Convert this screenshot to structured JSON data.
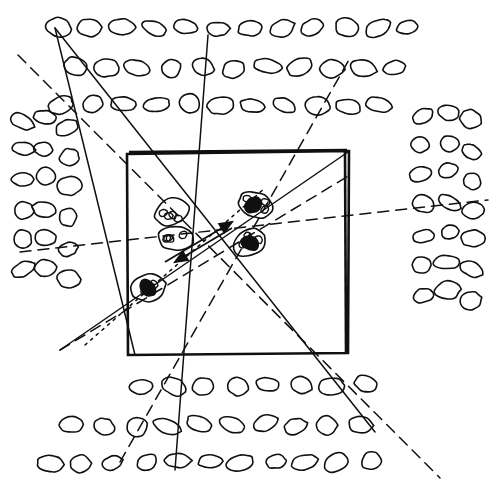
{
  "figure": {
    "style": "pen-and-ink line drawing, black on white",
    "canvas": {
      "width": 498,
      "height": 497,
      "background": "#ffffff"
    },
    "stroke_color": "#101010",
    "labels_visible": []
  },
  "chart_data": {
    "type": "scatter",
    "title": "",
    "xlabel": "",
    "ylabel": "",
    "grid": false,
    "legend": null,
    "xlim": [
      0,
      498
    ],
    "ylim": [
      0,
      497
    ],
    "boundary_box": {
      "x": 127,
      "y": 152,
      "width": 222,
      "height": 202
    },
    "series": [
      {
        "name": "background-oval-field",
        "marker": "ellipse-outline",
        "rows": [
          {
            "row": "top-1",
            "y": 28,
            "x": [
              58,
              90,
              122,
              153,
              185,
              217,
              249,
              281,
              313,
              345,
              377,
              409
            ]
          },
          {
            "row": "top-2",
            "y": 68,
            "x": [
              74,
              106,
              138,
              170,
              202,
              234,
              266,
              298,
              330,
              362,
              394
            ]
          },
          {
            "row": "top-3",
            "y": 105,
            "x": [
              60,
              92,
              124,
              156,
              188,
              220,
              252,
              284,
              316,
              348,
              380
            ]
          },
          {
            "row": "left-1",
            "x": 22,
            "y": [
              120,
              150,
              180,
              210,
              240,
              270
            ]
          },
          {
            "row": "left-2",
            "x": 45,
            "y": [
              118,
              148,
              178,
              208,
              238,
              268
            ]
          },
          {
            "row": "left-3",
            "x": 68,
            "y": [
              128,
              158,
              188,
              218,
              248,
              278
            ]
          },
          {
            "row": "right-1",
            "x": 422,
            "y": [
              115,
              145,
              175,
              205,
              235,
              265,
              295
            ]
          },
          {
            "row": "right-2",
            "x": 448,
            "y": [
              112,
              142,
              172,
              202,
              232,
              262,
              292
            ]
          },
          {
            "row": "right-3",
            "x": 472,
            "y": [
              120,
              150,
              180,
              210,
              240,
              270,
              300
            ]
          },
          {
            "row": "bottom-1",
            "y": 385,
            "x": [
              140,
              172,
              204,
              236,
              268,
              300,
              332,
              364
            ]
          },
          {
            "row": "bottom-2",
            "y": 425,
            "x": [
              72,
              104,
              136,
              168,
              200,
              232,
              264,
              296,
              328,
              360
            ]
          },
          {
            "row": "bottom-3",
            "y": 462,
            "x": [
              50,
              82,
              114,
              146,
              178,
              210,
              242,
              274,
              306,
              338,
              370
            ]
          }
        ]
      },
      {
        "name": "central-clusters",
        "marker": "ellipse-cluster",
        "points": [
          {
            "id": "cluster-upper-left",
            "x": 172,
            "y": 212,
            "label": ""
          },
          {
            "id": "cluster-upper-right",
            "x": 256,
            "y": 205,
            "label": ""
          },
          {
            "id": "cluster-mid",
            "x": 176,
            "y": 238,
            "label": ""
          },
          {
            "id": "cluster-right-mid",
            "x": 250,
            "y": 243,
            "label": ""
          },
          {
            "id": "cluster-lower-left",
            "x": 148,
            "y": 288,
            "label": ""
          }
        ]
      }
    ],
    "connector_lines": [
      {
        "id": "solid-1",
        "style": "solid",
        "from": [
          55,
          28
        ],
        "to": [
          375,
          432
        ]
      },
      {
        "id": "solid-2",
        "style": "solid",
        "from": [
          55,
          28
        ],
        "to": [
          135,
          355
        ]
      },
      {
        "id": "solid-3",
        "style": "solid",
        "from": [
          208,
          35
        ],
        "to": [
          175,
          470
        ]
      },
      {
        "id": "solid-4",
        "style": "solid",
        "from": [
          348,
          152
        ],
        "to": [
          60,
          350
        ]
      },
      {
        "id": "dashed-1",
        "style": "dashed",
        "from": [
          18,
          55
        ],
        "to": [
          440,
          478
        ]
      },
      {
        "id": "dashed-2",
        "style": "dashed",
        "from": [
          20,
          252
        ],
        "to": [
          488,
          200
        ]
      },
      {
        "id": "dashed-3",
        "style": "dashed",
        "from": [
          60,
          350
        ],
        "to": [
          350,
          175
        ]
      },
      {
        "id": "dashed-4",
        "style": "dashed",
        "from": [
          120,
          462
        ],
        "to": [
          350,
          58
        ]
      },
      {
        "id": "dotted-1",
        "style": "dotted",
        "from": [
          85,
          345
        ],
        "to": [
          265,
          188
        ]
      },
      {
        "id": "arrow-1",
        "style": "solid-arrow",
        "from": [
          232,
          228
        ],
        "to": [
          175,
          262
        ]
      },
      {
        "id": "arrow-2",
        "style": "solid-arrow",
        "from": [
          165,
          262
        ],
        "to": [
          232,
          222
        ]
      }
    ]
  }
}
